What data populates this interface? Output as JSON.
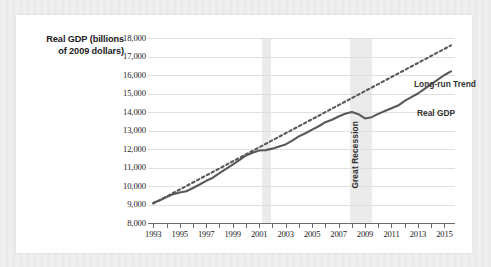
{
  "axis_title": {
    "line1": "Real GDP (billions",
    "line2": "of 2009 dollars)"
  },
  "annotations": {
    "trend": "Long-run Trend",
    "gdp": "Real GDP",
    "recession": "Great Recession"
  },
  "colors": {
    "card": "#ffffff",
    "page_background": "#e9e9e9",
    "gridline": "#dfdfdf",
    "recession_band": "#ebebeb",
    "series_line": "#58595b",
    "trend_line": "#58595b",
    "axis": "#6b6b6b",
    "text": "#222222"
  },
  "chart_data": {
    "type": "line",
    "title": "",
    "subtitle": "",
    "xlabel": "",
    "ylabel": "Real GDP (billions of 2009 dollars)",
    "xlim": [
      1992.6,
      2015.8
    ],
    "ylim": [
      8000,
      18000
    ],
    "grid": true,
    "legend_position": "inline-annotations",
    "y_ticks": [
      8000,
      9000,
      10000,
      11000,
      12000,
      13000,
      14000,
      15000,
      16000,
      17000,
      18000
    ],
    "y_tick_labels": [
      "8,000",
      "9,000",
      "10,000",
      "11,000",
      "12,000",
      "13,000",
      "14,000",
      "15,000",
      "16,000",
      "17,000",
      "18,000"
    ],
    "x_ticks": [
      1993,
      1994,
      1995,
      1996,
      1997,
      1998,
      1999,
      2000,
      2001,
      2002,
      2003,
      2004,
      2005,
      2006,
      2007,
      2008,
      2009,
      2010,
      2011,
      2012,
      2013,
      2014,
      2015
    ],
    "x_tick_labels_shown": [
      "1993",
      "1995",
      "1997",
      "1999",
      "2001",
      "2003",
      "2005",
      "2007",
      "2009",
      "2011",
      "2013",
      "2015"
    ],
    "shaded_regions": [
      {
        "label": "",
        "x_start": 2001.2,
        "x_end": 2001.9
      },
      {
        "label": "Great Recession",
        "x_start": 2007.9,
        "x_end": 2009.5
      }
    ],
    "x": [
      1993.0,
      1993.5,
      1994.0,
      1994.5,
      1995.0,
      1995.5,
      1996.0,
      1996.5,
      1997.0,
      1997.5,
      1998.0,
      1998.5,
      1999.0,
      1999.5,
      2000.0,
      2000.5,
      2001.0,
      2001.5,
      2002.0,
      2002.5,
      2003.0,
      2003.5,
      2004.0,
      2004.5,
      2005.0,
      2005.5,
      2006.0,
      2006.5,
      2007.0,
      2007.5,
      2008.0,
      2008.5,
      2009.0,
      2009.5,
      2010.0,
      2010.5,
      2011.0,
      2011.5,
      2012.0,
      2012.5,
      2013.0,
      2013.5,
      2014.0,
      2014.5,
      2015.0,
      2015.5
    ],
    "series": [
      {
        "name": "Real GDP",
        "style": "solid",
        "values": [
          9100,
          9230,
          9400,
          9560,
          9650,
          9720,
          9890,
          10080,
          10280,
          10450,
          10700,
          10930,
          11150,
          11400,
          11650,
          11800,
          11920,
          11940,
          12020,
          12140,
          12250,
          12450,
          12680,
          12850,
          13050,
          13230,
          13450,
          13580,
          13760,
          13900,
          14000,
          13880,
          13650,
          13720,
          13900,
          14050,
          14200,
          14350,
          14600,
          14800,
          15000,
          15250,
          15500,
          15750,
          16000,
          16200
        ]
      },
      {
        "name": "Long-run Trend",
        "style": "dashed",
        "values": [
          9050,
          9240,
          9430,
          9620,
          9810,
          10000,
          10190,
          10380,
          10570,
          10760,
          10950,
          11140,
          11330,
          11520,
          11710,
          11900,
          12090,
          12280,
          12470,
          12660,
          12850,
          13040,
          13230,
          13420,
          13610,
          13800,
          13990,
          14180,
          14370,
          14560,
          14750,
          14940,
          15130,
          15320,
          15510,
          15700,
          15890,
          16080,
          16270,
          16460,
          16650,
          16840,
          17030,
          17220,
          17410,
          17600
        ]
      }
    ]
  }
}
